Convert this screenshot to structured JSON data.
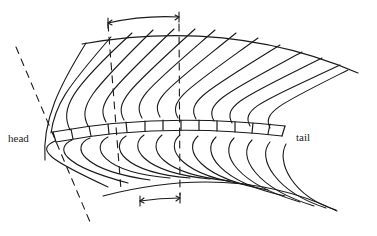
{
  "diagram": {
    "labels": {
      "head": "head",
      "tail": "tail"
    },
    "stroke_color": "#1a1a1a",
    "background": "#ffffff",
    "upper_boundary": "M 80 44 Q 240 20 355 72",
    "lower_boundary": "M 102 196 Q 240 160 336 210",
    "body_segments_count": 14,
    "upper_measure_marker": {
      "x1": 108,
      "x2": 179,
      "y": 18
    },
    "lower_measure_marker": {
      "x1": 140,
      "x2": 180,
      "y": 198
    },
    "dashed_lines": [
      {
        "x1": 16,
        "y1": 47,
        "x2": 90,
        "y2": 222
      },
      {
        "x1": 108,
        "y1": 22,
        "x2": 121,
        "y2": 190
      },
      {
        "x1": 179,
        "y1": 22,
        "x2": 180,
        "y2": 195
      }
    ]
  }
}
